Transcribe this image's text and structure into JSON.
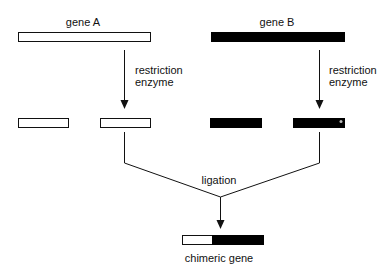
{
  "labels": {
    "gene_a": "gene A",
    "gene_b": "gene B",
    "enzyme_a_line1": "restriction",
    "enzyme_a_line2": "enzyme",
    "enzyme_b_line1": "restriction",
    "enzyme_b_line2": "enzyme",
    "ligation": "ligation",
    "chimeric": "chimeric gene"
  },
  "colors": {
    "gene_a_fill": "#ffffff",
    "gene_b_fill": "#000000",
    "stroke": "#111111"
  }
}
